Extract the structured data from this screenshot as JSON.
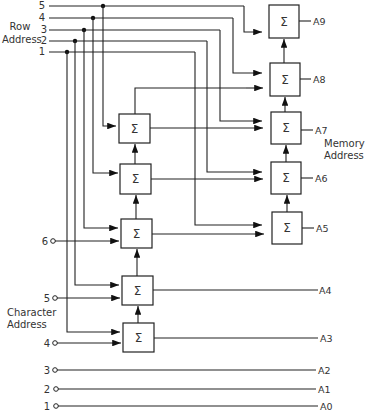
{
  "diagram": {
    "type": "adder-based address multiplexing circuit",
    "row_address": {
      "label_line1": "Row",
      "label_line2": "Address",
      "inputs": [
        "5",
        "4",
        "3",
        "2",
        "1"
      ]
    },
    "character_address": {
      "label_line1": "Character",
      "label_line2": "Address",
      "inputs": [
        "6",
        "5",
        "4"
      ]
    },
    "passthrough_inputs": [
      "3",
      "2",
      "1"
    ],
    "memory_address": {
      "label_line1": "Memory",
      "label_line2": "Address",
      "outputs": [
        "A9",
        "A8",
        "A7",
        "A6",
        "A5",
        "A4",
        "A3",
        "A2",
        "A1",
        "A0"
      ]
    },
    "adder_symbol": "Σ",
    "adders": [
      {
        "id": "sum-a9",
        "output": "A9"
      },
      {
        "id": "sum-a8",
        "output": "A8"
      },
      {
        "id": "sum-a7",
        "output": "A7"
      },
      {
        "id": "sum-a6",
        "output": "A6"
      },
      {
        "id": "sum-a5",
        "output": "A5"
      },
      {
        "id": "sum-left-top",
        "output": "to A8"
      },
      {
        "id": "sum-left-2",
        "output": "to A7"
      },
      {
        "id": "sum-left-3",
        "output": "to A6"
      },
      {
        "id": "sum-a4",
        "output": "A4"
      },
      {
        "id": "sum-a3",
        "output": "A3"
      }
    ],
    "colors": {
      "line": "#222222",
      "text": "#333333",
      "background": "#ffffff"
    }
  }
}
